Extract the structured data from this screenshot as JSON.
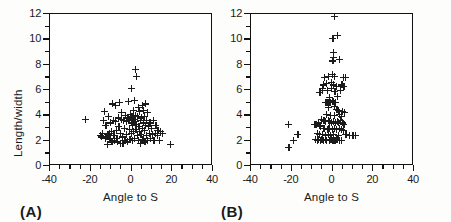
{
  "figure": {
    "background_color": "#fdfdfc",
    "ink_color": "#1b1b1b"
  },
  "panels": [
    {
      "tag": "(A)",
      "xlabel": "Angle to S",
      "ylabel": "Length/width",
      "show_ylabel": true
    },
    {
      "tag": "(B)",
      "xlabel": "Angle to S",
      "ylabel": "",
      "show_ylabel": false
    }
  ],
  "chart_data": [
    {
      "type": "scatter",
      "title": "(A)",
      "xlabel": "Angle to S",
      "ylabel": "Length/width",
      "xlim": [
        -40,
        40
      ],
      "ylim": [
        0,
        12
      ],
      "xticks": [
        -40,
        -30,
        -20,
        -10,
        0,
        10,
        20,
        30,
        40
      ],
      "xticklabels": [
        "-40",
        "",
        "-20",
        "",
        "0",
        "",
        "20",
        "",
        "40"
      ],
      "yticks": [
        0,
        1,
        2,
        3,
        4,
        5,
        6,
        7,
        8,
        9,
        10,
        11,
        12
      ],
      "yticklabels": [
        "0",
        "",
        "2",
        "",
        "4",
        "",
        "6",
        "",
        "8",
        "",
        "10",
        "",
        "12"
      ],
      "grid": false,
      "legend": null,
      "marker": "plus",
      "marker_color": "#1b1b1b",
      "points": [
        [
          -22.8,
          3.7
        ],
        [
          -15.4,
          2.4
        ],
        [
          -14.8,
          2.3
        ],
        [
          -14.2,
          2.6
        ],
        [
          -13.6,
          3.6
        ],
        [
          -13.4,
          4.3
        ],
        [
          -13.0,
          2.2
        ],
        [
          -12.6,
          3.2
        ],
        [
          -12.2,
          2.3
        ],
        [
          -12.0,
          1.7
        ],
        [
          -11.6,
          2.5
        ],
        [
          -11.2,
          3.9
        ],
        [
          -10.8,
          2.6
        ],
        [
          -10.6,
          2.1
        ],
        [
          -10.2,
          3.4
        ],
        [
          -9.8,
          2.7
        ],
        [
          -9.6,
          1.9
        ],
        [
          -9.2,
          4.9
        ],
        [
          -9.0,
          3.6
        ],
        [
          -8.6,
          2.4
        ],
        [
          -8.4,
          2.0
        ],
        [
          -8.0,
          4.8
        ],
        [
          -7.8,
          3.5
        ],
        [
          -7.4,
          2.8
        ],
        [
          -7.2,
          2.2
        ],
        [
          -6.8,
          1.9
        ],
        [
          -6.6,
          3.8
        ],
        [
          -6.2,
          3.1
        ],
        [
          -6.0,
          5.0
        ],
        [
          -5.6,
          2.6
        ],
        [
          -5.4,
          1.8
        ],
        [
          -5.0,
          3.7
        ],
        [
          -4.8,
          4.2
        ],
        [
          -4.4,
          2.3
        ],
        [
          -4.2,
          1.8
        ],
        [
          -3.8,
          3.6
        ],
        [
          -3.6,
          3.0
        ],
        [
          -3.2,
          2.0
        ],
        [
          -3.0,
          4.0
        ],
        [
          -2.6,
          3.5
        ],
        [
          -2.4,
          2.5
        ],
        [
          -2.0,
          1.9
        ],
        [
          -1.8,
          3.8
        ],
        [
          -1.6,
          5.1
        ],
        [
          -1.2,
          2.9
        ],
        [
          -1.0,
          3.6
        ],
        [
          -0.8,
          2.1
        ],
        [
          -0.6,
          4.1
        ],
        [
          -0.2,
          3.4
        ],
        [
          0.0,
          2.6
        ],
        [
          0.0,
          6.1
        ],
        [
          0.2,
          3.9
        ],
        [
          0.4,
          2.0
        ],
        [
          0.6,
          3.2
        ],
        [
          0.8,
          4.4
        ],
        [
          1.0,
          2.7
        ],
        [
          1.2,
          3.7
        ],
        [
          1.4,
          5.2
        ],
        [
          1.6,
          2.2
        ],
        [
          1.8,
          3.5
        ],
        [
          1.8,
          7.6
        ],
        [
          2.0,
          4.0
        ],
        [
          2.2,
          2.9
        ],
        [
          2.4,
          7.1
        ],
        [
          2.6,
          3.3
        ],
        [
          2.8,
          2.4
        ],
        [
          3.0,
          3.9
        ],
        [
          3.2,
          4.6
        ],
        [
          3.4,
          2.0
        ],
        [
          3.6,
          3.1
        ],
        [
          3.8,
          2.7
        ],
        [
          4.0,
          4.3
        ],
        [
          4.2,
          3.6
        ],
        [
          4.4,
          1.8
        ],
        [
          4.6,
          2.5
        ],
        [
          5.0,
          3.8
        ],
        [
          5.2,
          3.0
        ],
        [
          5.4,
          4.8
        ],
        [
          5.6,
          2.1
        ],
        [
          5.8,
          3.4
        ],
        [
          6.0,
          4.4
        ],
        [
          6.2,
          2.8
        ],
        [
          6.4,
          3.9
        ],
        [
          6.6,
          1.9
        ],
        [
          6.8,
          3.2
        ],
        [
          7.0,
          4.9
        ],
        [
          7.2,
          2.4
        ],
        [
          7.4,
          3.6
        ],
        [
          7.8,
          2.0
        ],
        [
          8.0,
          4.2
        ],
        [
          8.2,
          3.1
        ],
        [
          8.6,
          2.6
        ],
        [
          9.0,
          3.4
        ],
        [
          9.4,
          2.2
        ],
        [
          9.8,
          3.0
        ],
        [
          10.2,
          2.5
        ],
        [
          10.6,
          3.6
        ],
        [
          11.0,
          2.0
        ],
        [
          11.6,
          2.6
        ],
        [
          12.0,
          3.2
        ],
        [
          12.6,
          2.4
        ],
        [
          13.0,
          2.8
        ],
        [
          13.6,
          2.0
        ],
        [
          14.2,
          2.7
        ],
        [
          15.0,
          2.6
        ],
        [
          19.2,
          1.7
        ]
      ]
    },
    {
      "type": "scatter",
      "title": "(B)",
      "xlabel": "Angle to S",
      "ylabel": "",
      "xlim": [
        -40,
        40
      ],
      "ylim": [
        0,
        12
      ],
      "xticks": [
        -40,
        -30,
        -20,
        -10,
        0,
        10,
        20,
        30,
        40
      ],
      "xticklabels": [
        "-40",
        "",
        "-20",
        "",
        "0",
        "",
        "20",
        "",
        "40"
      ],
      "yticks": [
        0,
        1,
        2,
        3,
        4,
        5,
        6,
        7,
        8,
        9,
        10,
        11,
        12
      ],
      "yticklabels": [
        "0",
        "",
        "2",
        "",
        "4",
        "",
        "6",
        "",
        "8",
        "",
        "10",
        "",
        "12"
      ],
      "grid": false,
      "legend": null,
      "marker": "plus",
      "marker_color": "#1b1b1b",
      "points": [
        [
          1.0,
          11.8
        ],
        [
          0.2,
          10.1
        ],
        [
          2.4,
          10.3
        ],
        [
          0.4,
          9.0
        ],
        [
          0.6,
          8.6
        ],
        [
          0.2,
          8.3
        ],
        [
          3.2,
          8.4
        ],
        [
          -0.2,
          7.2
        ],
        [
          -4.0,
          7.0
        ],
        [
          -2.2,
          7.1
        ],
        [
          0.8,
          7.1
        ],
        [
          5.4,
          7.0
        ],
        [
          6.4,
          7.0
        ],
        [
          -4.6,
          6.4
        ],
        [
          -3.0,
          6.5
        ],
        [
          -0.4,
          6.6
        ],
        [
          0.6,
          6.4
        ],
        [
          2.0,
          6.3
        ],
        [
          4.6,
          6.4
        ],
        [
          5.6,
          6.3
        ],
        [
          -5.0,
          6.1
        ],
        [
          -4.8,
          6.0
        ],
        [
          -2.6,
          6.0
        ],
        [
          -0.6,
          6.1
        ],
        [
          1.2,
          5.9
        ],
        [
          3.8,
          6.0
        ],
        [
          -6.2,
          5.8
        ],
        [
          -1.6,
          5.4
        ],
        [
          0.0,
          5.2
        ],
        [
          2.6,
          5.5
        ],
        [
          -3.6,
          5.0
        ],
        [
          -3.0,
          5.0
        ],
        [
          -2.4,
          5.0
        ],
        [
          -1.8,
          5.0
        ],
        [
          -1.2,
          5.0
        ],
        [
          0.2,
          5.1
        ],
        [
          1.4,
          5.0
        ],
        [
          -2.0,
          4.6
        ],
        [
          0.8,
          4.7
        ],
        [
          2.2,
          4.5
        ],
        [
          2.8,
          4.4
        ],
        [
          5.0,
          4.3
        ],
        [
          -2.8,
          4.1
        ],
        [
          -1.0,
          4.0
        ],
        [
          1.0,
          4.0
        ],
        [
          3.4,
          4.1
        ],
        [
          4.4,
          3.9
        ],
        [
          6.0,
          4.2
        ],
        [
          -5.4,
          3.7
        ],
        [
          -4.2,
          3.6
        ],
        [
          -3.4,
          3.5
        ],
        [
          -2.2,
          3.6
        ],
        [
          -1.4,
          3.5
        ],
        [
          -0.6,
          3.4
        ],
        [
          0.4,
          3.5
        ],
        [
          1.6,
          3.4
        ],
        [
          2.4,
          3.5
        ],
        [
          3.0,
          3.4
        ],
        [
          3.8,
          3.6
        ],
        [
          4.8,
          3.4
        ],
        [
          5.6,
          3.3
        ],
        [
          -21.8,
          3.3
        ],
        [
          -8.6,
          3.3
        ],
        [
          -7.8,
          3.3
        ],
        [
          -7.0,
          3.4
        ],
        [
          -6.2,
          3.2
        ],
        [
          -5.8,
          3.1
        ],
        [
          -4.6,
          3.0
        ],
        [
          -3.8,
          3.0
        ],
        [
          -2.6,
          2.9
        ],
        [
          -1.8,
          3.0
        ],
        [
          -0.2,
          2.9
        ],
        [
          1.0,
          3.0
        ],
        [
          2.0,
          2.9
        ],
        [
          3.4,
          3.0
        ],
        [
          4.2,
          2.9
        ],
        [
          5.2,
          2.8
        ],
        [
          -7.4,
          2.6
        ],
        [
          -6.6,
          2.5
        ],
        [
          -5.0,
          2.5
        ],
        [
          -3.4,
          2.4
        ],
        [
          -2.2,
          2.5
        ],
        [
          -1.0,
          2.4
        ],
        [
          0.6,
          2.5
        ],
        [
          2.8,
          2.4
        ],
        [
          6.6,
          2.5
        ],
        [
          8.2,
          2.4
        ],
        [
          10.0,
          2.4
        ],
        [
          11.4,
          2.4
        ],
        [
          -17.0,
          2.5
        ],
        [
          -19.0,
          2.0
        ],
        [
          -8.2,
          2.1
        ],
        [
          -7.6,
          2.0
        ],
        [
          -6.8,
          2.1
        ],
        [
          -6.0,
          2.0
        ],
        [
          -5.2,
          2.1
        ],
        [
          -4.4,
          2.0
        ],
        [
          -3.6,
          2.1
        ],
        [
          -2.8,
          2.0
        ],
        [
          -1.6,
          2.0
        ],
        [
          -0.8,
          2.1
        ],
        [
          0.2,
          2.0
        ],
        [
          1.2,
          2.0
        ],
        [
          2.2,
          2.1
        ],
        [
          3.2,
          2.0
        ],
        [
          4.4,
          2.0
        ],
        [
          -21.4,
          1.5
        ]
      ]
    }
  ]
}
